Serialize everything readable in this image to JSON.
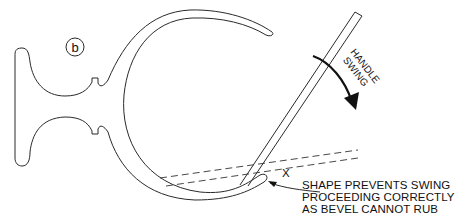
{
  "figure": {
    "panel_label": "b",
    "annotations": {
      "handle_swing": [
        "HANDLE",
        "SWING"
      ],
      "mark": "X",
      "callout_lines": [
        "SHAPE PREVENTS SWING",
        "PROCEEDING CORRECTLY",
        "AS BEVEL CANNOT RUB"
      ]
    },
    "colors": {
      "line": "#2a2a2a",
      "background": "#ffffff"
    }
  }
}
